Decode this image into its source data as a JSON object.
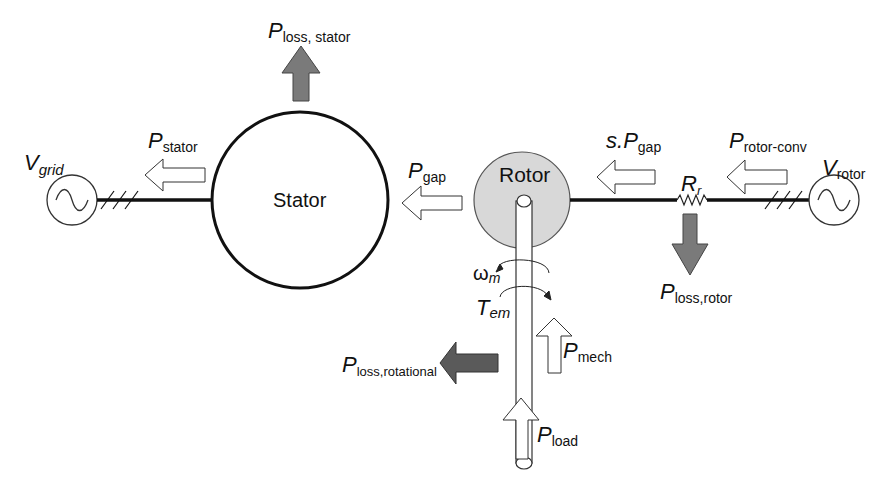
{
  "diagram": {
    "colors": {
      "line": "#111111",
      "loss_arrow_fill": "#7a7a7a",
      "loss_rotational_fill": "#5a5a5a",
      "rotor_fill": "#d8d8d8",
      "flow_arrow_fill": "#ffffff"
    },
    "nodes": {
      "stator": {
        "label": "Stator"
      },
      "rotor": {
        "label": "Rotor"
      }
    },
    "labels": {
      "v_grid": {
        "main": "V",
        "sub": "grid"
      },
      "v_rotor": {
        "main": "V",
        "sub": "rotor"
      },
      "p_stator": {
        "main": "P",
        "sub": "stator"
      },
      "p_loss_stator": {
        "main": "P",
        "sub": "loss, stator"
      },
      "p_gap": {
        "main": "P",
        "sub": "gap"
      },
      "s_p_gap": {
        "prefix": "s.",
        "main": "P",
        "sub": "gap"
      },
      "p_rotor_conv": {
        "main": "P",
        "sub": "rotor-conv"
      },
      "r_r": {
        "main": "R",
        "sub": "r"
      },
      "p_loss_rotor": {
        "main": "P",
        "sub": "loss,rotor"
      },
      "omega_m": {
        "main": "ω",
        "sub": "m"
      },
      "t_em": {
        "main": "T",
        "sub": "em"
      },
      "p_mech": {
        "main": "P",
        "sub": "mech"
      },
      "p_loss_rotational": {
        "main": "P",
        "sub": "loss,rotational"
      },
      "p_load": {
        "main": "P",
        "sub": "load"
      }
    }
  }
}
